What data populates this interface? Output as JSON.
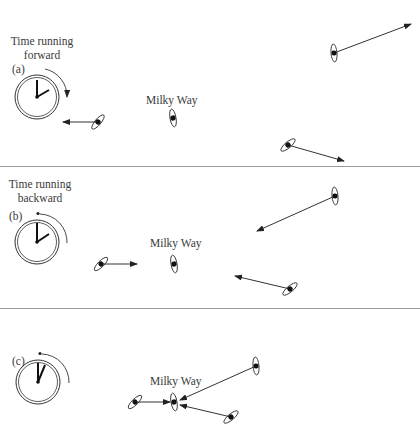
{
  "panels": {
    "a": {
      "tag": "(a)",
      "caption_line1": "Time running",
      "caption_line2": "forward",
      "galaxy_label": "Milky Way"
    },
    "b": {
      "tag": "(b)",
      "caption_line1": "Time running",
      "caption_line2": "backward",
      "galaxy_label": "Milky Way"
    },
    "c": {
      "tag": "(c)",
      "galaxy_label": "Milky Way"
    }
  }
}
